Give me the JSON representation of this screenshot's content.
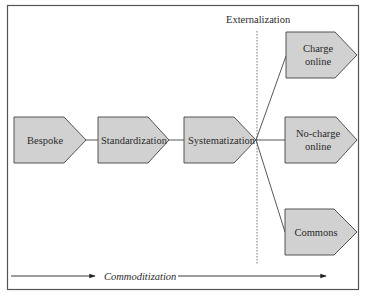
{
  "diagram": {
    "frame_color": "#555555",
    "node_fill": "#d1d1d1",
    "node_stroke": "#444444",
    "externalization_label": "Externalization",
    "commoditization_label": "Commoditization",
    "nodes": [
      {
        "id": "bespoke",
        "lines": [
          "Bespoke"
        ]
      },
      {
        "id": "standardization",
        "lines": [
          "Standardization"
        ]
      },
      {
        "id": "systematization",
        "lines": [
          "Systematization"
        ]
      },
      {
        "id": "charge-online",
        "lines": [
          "Charge",
          "online"
        ]
      },
      {
        "id": "no-charge-online",
        "lines": [
          "No-charge",
          "online"
        ]
      },
      {
        "id": "commons",
        "lines": [
          "Commons"
        ]
      }
    ],
    "edges": [
      [
        "bespoke",
        "standardization"
      ],
      [
        "standardization",
        "systematization"
      ],
      [
        "systematization",
        "charge-online"
      ],
      [
        "systematization",
        "no-charge-online"
      ],
      [
        "systematization",
        "commons"
      ]
    ]
  }
}
